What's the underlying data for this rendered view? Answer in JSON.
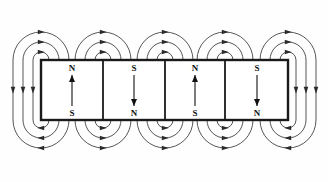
{
  "figure": {
    "background_color": "#fefefe",
    "line_color": "#1a1a1a",
    "field_line_color": "#2b2b2b",
    "label_color": "#111111"
  },
  "magnet_bar": {
    "x": 41,
    "y": 60,
    "width": 247,
    "height": 60,
    "border_width": 2.4,
    "divider_width": 1.8,
    "dividers": [
      103,
      165,
      225
    ],
    "cells": [
      {
        "index": 0,
        "x_start": 41,
        "x_end": 103,
        "center_x": 72,
        "top_label": "N",
        "bottom_label": "S",
        "arrow_direction": "up"
      },
      {
        "index": 1,
        "x_start": 103,
        "x_end": 165,
        "center_x": 134,
        "top_label": "S",
        "bottom_label": "N",
        "arrow_direction": "down"
      },
      {
        "index": 2,
        "x_start": 165,
        "x_end": 225,
        "center_x": 195,
        "top_label": "N",
        "bottom_label": "S",
        "arrow_direction": "up"
      },
      {
        "index": 3,
        "x_start": 225,
        "x_end": 288,
        "center_x": 257,
        "top_label": "S",
        "bottom_label": "N",
        "arrow_direction": "down"
      }
    ]
  },
  "field_lines": {
    "group_centers": [
      41,
      103,
      165,
      225,
      288
    ],
    "nest_radii": [
      8,
      18,
      28
    ],
    "top_edge_y": 60,
    "bottom_edge_y": 120,
    "arrowhead_size": 3.2,
    "stroke_width": 0.8,
    "description": "Three nested closed loops per boundary, arcing above and below the magnet chain, with directional arrowheads at each arc apex and along the outer returns."
  },
  "chart_data": {
    "type": "diagram",
    "magnet_cells": [
      {
        "top_pole": "N",
        "bottom_pole": "S",
        "moment": "up"
      },
      {
        "top_pole": "S",
        "bottom_pole": "N",
        "moment": "down"
      },
      {
        "top_pole": "N",
        "bottom_pole": "S",
        "moment": "up"
      },
      {
        "top_pole": "S",
        "bottom_pole": "N",
        "moment": "down"
      }
    ],
    "loop_groups": 5,
    "loops_per_group": 3,
    "total_arcs_top": 15,
    "total_arcs_bottom": 15
  }
}
